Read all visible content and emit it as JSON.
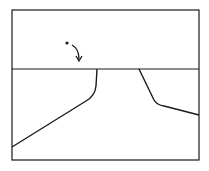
{
  "diagram": {
    "width": 209,
    "height": 171,
    "stroke_color": "#1a1a1a",
    "background": "#ffffff",
    "frame": {
      "x": 12,
      "y": 10,
      "w": 187,
      "h": 150
    },
    "horizon_line": {
      "y": 69
    },
    "left_path": "M97,69 L96,86 Q95,96 86,101 L12,147",
    "right_path": "M139,69 L154,100 Q157,105 164,106 L199,115",
    "dot": {
      "cx": 67,
      "cy": 43,
      "r": 1.6
    },
    "arrow_path": "M72,45 Q79,49 79,59",
    "arrow_head": "M76,56 L79,61 L82,56"
  }
}
